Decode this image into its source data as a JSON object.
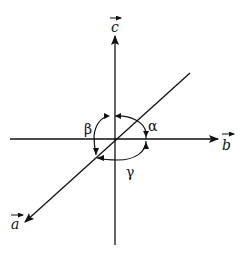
{
  "diagram": {
    "colors": {
      "ink": "#111111",
      "background": "#ffffff"
    },
    "axes": [
      {
        "id": "c",
        "label": "c",
        "vector_arrow": "→",
        "direction": "up"
      },
      {
        "id": "b",
        "label": "b",
        "vector_arrow": "→",
        "direction": "right"
      },
      {
        "id": "a",
        "label": "a",
        "vector_arrow": "→",
        "direction": "down-left (toward viewer)"
      }
    ],
    "angles": [
      {
        "id": "alpha",
        "symbol": "α",
        "between": [
          "b",
          "c"
        ]
      },
      {
        "id": "beta",
        "symbol": "β",
        "between": [
          "a",
          "c"
        ]
      },
      {
        "id": "gamma",
        "symbol": "γ",
        "between": [
          "a",
          "b"
        ]
      }
    ]
  }
}
